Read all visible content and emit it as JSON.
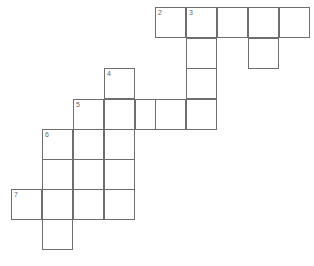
{
  "puzzle": {
    "type": "crossword-grid",
    "title": "Crossword puzzle grid",
    "cell_size": 31,
    "origin_x": 11,
    "origin_y": 7,
    "columns_x": [
      11,
      42,
      73,
      104,
      135,
      155,
      186,
      217,
      248,
      279
    ],
    "rows_y": [
      7,
      38,
      68,
      99,
      129,
      159,
      189,
      219
    ],
    "colors": {
      "background": "#ffffff",
      "cell_fill": "#ffffff",
      "grid_line": "#6e6e6e",
      "number_text": "#666666"
    },
    "cells": [
      {
        "name": "cell-r0c5",
        "row": 0,
        "col": 5,
        "number": "2"
      },
      {
        "name": "cell-r0c6",
        "row": 0,
        "col": 6,
        "number": "3"
      },
      {
        "name": "cell-r0c7",
        "row": 0,
        "col": 7,
        "number": ""
      },
      {
        "name": "cell-r0c8",
        "row": 0,
        "col": 8,
        "number": ""
      },
      {
        "name": "cell-r0c9",
        "row": 0,
        "col": 9,
        "number": ""
      },
      {
        "name": "cell-r1c6",
        "row": 1,
        "col": 6,
        "number": ""
      },
      {
        "name": "cell-r1c8",
        "row": 1,
        "col": 8,
        "number": ""
      },
      {
        "name": "cell-r2c3",
        "row": 2,
        "col": 3,
        "number": "4"
      },
      {
        "name": "cell-r2c6",
        "row": 2,
        "col": 6,
        "number": ""
      },
      {
        "name": "cell-r3c2",
        "row": 3,
        "col": 2,
        "number": "5"
      },
      {
        "name": "cell-r3c3",
        "row": 3,
        "col": 3,
        "number": ""
      },
      {
        "name": "cell-r3c4",
        "row": 3,
        "col": 4,
        "number": ""
      },
      {
        "name": "cell-r3c5",
        "row": 3,
        "col": 5,
        "number": ""
      },
      {
        "name": "cell-r3c6",
        "row": 3,
        "col": 6,
        "number": ""
      },
      {
        "name": "cell-r4c1",
        "row": 4,
        "col": 1,
        "number": "6"
      },
      {
        "name": "cell-r4c2",
        "row": 4,
        "col": 2,
        "number": ""
      },
      {
        "name": "cell-r4c3",
        "row": 4,
        "col": 3,
        "number": ""
      },
      {
        "name": "cell-r5c1",
        "row": 5,
        "col": 1,
        "number": ""
      },
      {
        "name": "cell-r5c2",
        "row": 5,
        "col": 2,
        "number": ""
      },
      {
        "name": "cell-r5c3",
        "row": 5,
        "col": 3,
        "number": ""
      },
      {
        "name": "cell-r6c0",
        "row": 6,
        "col": 0,
        "number": "7"
      },
      {
        "name": "cell-r6c1",
        "row": 6,
        "col": 1,
        "number": ""
      },
      {
        "name": "cell-r6c2",
        "row": 6,
        "col": 2,
        "number": ""
      },
      {
        "name": "cell-r6c3",
        "row": 6,
        "col": 3,
        "number": ""
      },
      {
        "name": "cell-r7c1",
        "row": 7,
        "col": 1,
        "number": ""
      }
    ]
  }
}
